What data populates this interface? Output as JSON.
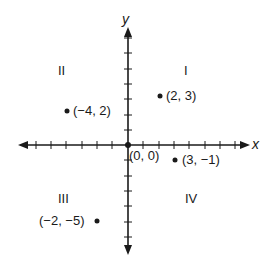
{
  "diagram": {
    "axes": {
      "x_label": "x",
      "y_label": "y",
      "origin_label": "(0, 0)"
    },
    "quadrants": [
      {
        "id": "I",
        "label": "I"
      },
      {
        "id": "II",
        "label": "II"
      },
      {
        "id": "III",
        "label": "III"
      },
      {
        "id": "IV",
        "label": "IV"
      }
    ],
    "points": [
      {
        "label": "(2, 3)",
        "x": 2,
        "y": 3,
        "quadrant": "I"
      },
      {
        "label": "(−4, 2)",
        "x": -4,
        "y": 2,
        "quadrant": "II"
      },
      {
        "label": "(3, −1)",
        "x": 3,
        "y": -1,
        "quadrant": "IV"
      },
      {
        "label": "(−2, −5)",
        "x": -2,
        "y": -5,
        "quadrant": "III"
      }
    ],
    "colors": {
      "ink": "#1a1a1a",
      "background": "#ffffff"
    }
  }
}
